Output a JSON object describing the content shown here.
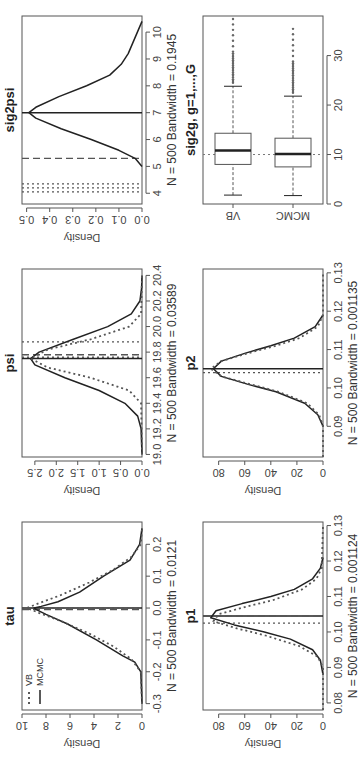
{
  "chart_data": [
    {
      "id": "tau",
      "type": "line",
      "title": "tau",
      "xlabel": "N = 500 Bandwidth = 0.0121",
      "ylabel": "Density",
      "xlim": [
        -0.32,
        0.27
      ],
      "ylim": [
        0,
        10
      ],
      "xticks": [
        "-0.3",
        "-0.2",
        "-0.1",
        "0.0",
        "0.1",
        "0.2"
      ],
      "xtick_values": [
        -0.3,
        -0.2,
        -0.1,
        0.0,
        0.1,
        0.2
      ],
      "yticks": [
        "0",
        "2",
        "4",
        "6",
        "8",
        "10"
      ],
      "ytick_values": [
        0,
        2,
        4,
        6,
        8,
        10
      ],
      "legend": {
        "entries": [
          {
            "label": "VB",
            "style": "dotted"
          },
          {
            "label": "MCMC",
            "style": "solid"
          }
        ],
        "position": "top-left"
      },
      "series": [
        {
          "name": "MCMC",
          "style": "solid",
          "x": [
            -0.3,
            -0.2,
            -0.17,
            -0.15,
            -0.1,
            -0.05,
            -0.02,
            -0.005,
            0.0,
            0.005,
            0.02,
            0.05,
            0.1,
            0.15,
            0.2,
            0.25
          ],
          "values": [
            0,
            0.1,
            0.6,
            1.6,
            3.8,
            6.2,
            8.0,
            8.8,
            9.0,
            8.4,
            7.0,
            5.2,
            3.2,
            1.0,
            0.2,
            0
          ]
        },
        {
          "name": "VB",
          "style": "dotted",
          "x": [
            -0.3,
            -0.2,
            -0.16,
            -0.12,
            -0.08,
            -0.04,
            -0.015,
            0.0,
            0.015,
            0.04,
            0.08,
            0.12,
            0.16,
            0.2,
            0.25
          ],
          "values": [
            0,
            0.1,
            0.9,
            2.4,
            4.4,
            6.8,
            8.6,
            9.6,
            8.6,
            6.8,
            4.4,
            2.4,
            0.9,
            0.1,
            0
          ]
        }
      ],
      "vlines": [
        {
          "x": 0.0,
          "style": "solid"
        },
        {
          "x": -0.005,
          "style": "dashed"
        },
        {
          "x": 0.0,
          "style": "dotted"
        }
      ]
    },
    {
      "id": "psi",
      "type": "line",
      "title": "psi",
      "xlabel": "N = 500 Bandwidth = 0.03589",
      "ylabel": "Density",
      "xlim": [
        18.98,
        20.45
      ],
      "ylim": [
        0,
        2.8
      ],
      "xticks": [
        "19.0",
        "19.2",
        "19.4",
        "19.6",
        "19.8",
        "20.0",
        "20.2",
        "20.4"
      ],
      "xtick_values": [
        19.0,
        19.2,
        19.4,
        19.6,
        19.8,
        20.0,
        20.2,
        20.4
      ],
      "yticks": [
        "0.0",
        "0.5",
        "1.0",
        "1.5",
        "2.0",
        "2.5"
      ],
      "ytick_values": [
        0.0,
        0.5,
        1.0,
        1.5,
        2.0,
        2.5
      ],
      "series": [
        {
          "name": "MCMC",
          "style": "solid",
          "x": [
            19.0,
            19.2,
            19.3,
            19.4,
            19.5,
            19.6,
            19.7,
            19.75,
            19.8,
            19.9,
            20.0,
            20.1,
            20.2,
            20.3,
            20.4
          ],
          "values": [
            0,
            0.02,
            0.1,
            0.4,
            1.0,
            1.8,
            2.5,
            2.6,
            2.4,
            1.6,
            0.8,
            0.25,
            0.05,
            0.01,
            0
          ]
        },
        {
          "name": "VB",
          "style": "dotted",
          "x": [
            19.0,
            19.4,
            19.5,
            19.6,
            19.68,
            19.75,
            19.82,
            19.9,
            20.0,
            20.1,
            20.4
          ],
          "values": [
            0,
            0.02,
            0.3,
            1.2,
            2.2,
            2.6,
            2.2,
            1.2,
            0.3,
            0.02,
            0
          ]
        }
      ],
      "vlines": [
        {
          "x": 19.75,
          "style": "solid"
        },
        {
          "x": 19.78,
          "style": "dashed"
        },
        {
          "x": 19.88,
          "style": "dotted"
        },
        {
          "x": 19.76,
          "style": "dotted"
        }
      ]
    },
    {
      "id": "sig2psi",
      "type": "line",
      "title": "sig2psi",
      "xlabel": "N = 500 Bandwidth = 0.1945",
      "ylabel": "Density",
      "xlim": [
        3.6,
        10.6
      ],
      "ylim": [
        0,
        0.52
      ],
      "xticks": [
        "4",
        "5",
        "6",
        "7",
        "8",
        "9",
        "10"
      ],
      "xtick_values": [
        4,
        5,
        6,
        7,
        8,
        9,
        10
      ],
      "yticks": [
        "0.0",
        "0.1",
        "0.2",
        "0.3",
        "0.4",
        "0.5"
      ],
      "ytick_values": [
        0.0,
        0.1,
        0.2,
        0.3,
        0.4,
        0.5
      ],
      "series": [
        {
          "name": "MCMC",
          "style": "solid",
          "x": [
            5.0,
            5.3,
            5.6,
            6.0,
            6.4,
            6.8,
            7.0,
            7.2,
            7.6,
            8.0,
            8.4,
            8.8,
            9.2,
            9.6,
            10.0,
            10.4
          ],
          "values": [
            0.0,
            0.03,
            0.1,
            0.22,
            0.35,
            0.46,
            0.49,
            0.46,
            0.36,
            0.24,
            0.14,
            0.09,
            0.06,
            0.04,
            0.02,
            0.0
          ]
        }
      ],
      "vlines": [
        {
          "x": 7.0,
          "style": "solid"
        },
        {
          "x": 5.3,
          "style": "dashed"
        },
        {
          "x": 4.35,
          "style": "dotted"
        },
        {
          "x": 4.2,
          "style": "dotted"
        },
        {
          "x": 4.05,
          "style": "dotted"
        }
      ]
    },
    {
      "id": "p1",
      "type": "line",
      "title": "p1",
      "xlabel": "N = 500 Bandwidth = 0.001124",
      "ylabel": "Density",
      "xlim": [
        0.078,
        0.131
      ],
      "ylim": [
        0,
        92
      ],
      "xticks": [
        "0.08",
        "0.09",
        "0.10",
        "0.11",
        "0.12",
        "0.13"
      ],
      "xtick_values": [
        0.08,
        0.09,
        0.1,
        0.11,
        0.12,
        0.13
      ],
      "yticks": [
        "0",
        "20",
        "40",
        "60",
        "80"
      ],
      "ytick_values": [
        0,
        20,
        40,
        60,
        80
      ],
      "series": [
        {
          "name": "MCMC",
          "style": "solid",
          "x": [
            0.088,
            0.092,
            0.095,
            0.098,
            0.1,
            0.102,
            0.104,
            0.106,
            0.108,
            0.11,
            0.112,
            0.115,
            0.118,
            0.121
          ],
          "values": [
            0,
            2,
            8,
            25,
            45,
            68,
            86,
            82,
            62,
            40,
            22,
            8,
            2,
            0
          ]
        },
        {
          "name": "VB",
          "style": "dotted",
          "x": [
            0.078,
            0.09,
            0.093,
            0.096,
            0.099,
            0.101,
            0.103,
            0.105,
            0.107,
            0.109,
            0.112,
            0.115,
            0.118,
            0.13
          ],
          "values": [
            0,
            0,
            4,
            18,
            44,
            66,
            84,
            80,
            60,
            38,
            16,
            5,
            1,
            0
          ]
        }
      ],
      "vlines": [
        {
          "x": 0.1045,
          "style": "solid"
        },
        {
          "x": 0.1045,
          "style": "dashed"
        },
        {
          "x": 0.1025,
          "style": "dotted"
        }
      ]
    },
    {
      "id": "p2",
      "type": "line",
      "title": "p2",
      "xlabel": "N = 500 Bandwidth = 0.001135",
      "ylabel": "Density",
      "xlim": [
        0.082,
        0.131
      ],
      "ylim": [
        0,
        92
      ],
      "xticks": [
        "0.09",
        "0.10",
        "0.11",
        "0.12",
        "0.13"
      ],
      "xtick_values": [
        0.09,
        0.1,
        0.11,
        0.12,
        0.13
      ],
      "yticks": [
        "0",
        "20",
        "40",
        "60",
        "80"
      ],
      "ytick_values": [
        0,
        20,
        40,
        60,
        80
      ],
      "series": [
        {
          "name": "MCMC",
          "style": "solid",
          "x": [
            0.09,
            0.093,
            0.096,
            0.099,
            0.101,
            0.103,
            0.105,
            0.107,
            0.109,
            0.111,
            0.113,
            0.116,
            0.119
          ],
          "values": [
            0,
            4,
            14,
            36,
            58,
            78,
            84,
            78,
            60,
            40,
            22,
            6,
            0
          ]
        },
        {
          "name": "VB",
          "style": "dotted",
          "x": [
            0.082,
            0.09,
            0.093,
            0.096,
            0.099,
            0.101,
            0.103,
            0.105,
            0.107,
            0.109,
            0.111,
            0.113,
            0.116,
            0.119,
            0.13
          ],
          "values": [
            0,
            0,
            3,
            12,
            34,
            56,
            78,
            86,
            78,
            58,
            36,
            18,
            4,
            0,
            0
          ]
        }
      ],
      "vlines": [
        {
          "x": 0.105,
          "style": "solid"
        },
        {
          "x": 0.104,
          "style": "dotted"
        }
      ]
    },
    {
      "id": "sig2g",
      "type": "box",
      "title": "sig2g, g=1,...,G",
      "xlim": [
        0,
        38
      ],
      "xticks": [
        "0",
        "10",
        "20",
        "30"
      ],
      "xtick_values": [
        0,
        10,
        20,
        30
      ],
      "categories": [
        "VB",
        "MCMC"
      ],
      "reference_line": 10,
      "boxes": [
        {
          "name": "VB",
          "whisker_low": 1.8,
          "q1": 8.0,
          "median": 10.8,
          "q3": 14.3,
          "whisker_high": 23.8,
          "outliers_from": 24.5,
          "outliers_to": 37.5
        },
        {
          "name": "MCMC",
          "whisker_low": 1.7,
          "q1": 7.5,
          "median": 10.1,
          "q3": 13.3,
          "whisker_high": 21.8,
          "outliers_from": 22.5,
          "outliers_to": 35.5
        }
      ]
    }
  ],
  "colors": {
    "axis": "#555555",
    "curve": "#222222",
    "vb": "#555555",
    "text": "#333333"
  }
}
